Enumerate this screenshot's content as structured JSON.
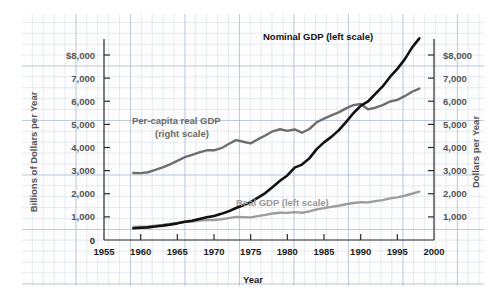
{
  "chart_data": {
    "type": "line",
    "title": "",
    "xlabel": "Year",
    "ylabel_left": "Billions of Dollars per Year",
    "ylabel_right": "Dollars per Year",
    "xlim": [
      1955,
      2000
    ],
    "xticks": [
      "1955",
      "1960",
      "1965",
      "1970",
      "1975",
      "1980",
      "1985",
      "1990",
      "1995",
      "2000"
    ],
    "ylim_left": [
      0,
      8000
    ],
    "ylim_right": [
      0,
      8000
    ],
    "yticks_left": [
      "0",
      "1,000",
      "2,000",
      "3,000",
      "4,000",
      "5,000",
      "6,000",
      "7,000",
      "$8,000"
    ],
    "yticks_right": [
      "1,000",
      "2,000",
      "3,000",
      "4,000",
      "5,000",
      "6,000",
      "7,000",
      "$8,000"
    ],
    "grid": true,
    "legend_position": "inline-annotations",
    "annotations": [
      {
        "name": "nominal-gdp-label",
        "text": "Nominal GDP (left scale)",
        "color": "#111111"
      },
      {
        "name": "per-capita-real-gdp-label",
        "text": "Per-capita real GDP",
        "color": "#6a6a6a"
      },
      {
        "name": "per-capita-real-gdp-sublabel",
        "text": "(right scale)",
        "color": "#6a6a6a"
      },
      {
        "name": "real-gdp-label",
        "text": "Real GDP (left scale)",
        "color": "#9a9a9a"
      }
    ],
    "series": [
      {
        "name": "Nominal GDP (left scale)",
        "axis": "left",
        "color": "#111111",
        "units": "Billions of Dollars per Year",
        "x": [
          1959,
          1960,
          1961,
          1962,
          1963,
          1964,
          1965,
          1966,
          1967,
          1968,
          1969,
          1970,
          1971,
          1972,
          1973,
          1974,
          1975,
          1976,
          1977,
          1978,
          1979,
          1980,
          1981,
          1982,
          1983,
          1984,
          1985,
          1986,
          1987,
          1988,
          1989,
          1990,
          1991,
          1992,
          1993,
          1994,
          1995,
          1996,
          1997,
          1998
        ],
        "values": [
          510,
          530,
          545,
          585,
          620,
          665,
          720,
          790,
          835,
          910,
          985,
          1040,
          1130,
          1240,
          1385,
          1500,
          1640,
          1830,
          2030,
          2290,
          2560,
          2790,
          3130,
          3260,
          3530,
          3930,
          4220,
          4460,
          4740,
          5100,
          5480,
          5800,
          5990,
          6320,
          6640,
          7050,
          7400,
          7810,
          8320,
          8720
        ]
      },
      {
        "name": "Real GDP (left scale)",
        "axis": "left",
        "color": "#9d9d9d",
        "units": "Billions of Dollars per Year",
        "x": [
          1959,
          1960,
          1961,
          1962,
          1963,
          1964,
          1965,
          1966,
          1967,
          1968,
          1969,
          1970,
          1971,
          1972,
          1973,
          1974,
          1975,
          1976,
          1977,
          1978,
          1979,
          1980,
          1981,
          1982,
          1983,
          1984,
          1985,
          1986,
          1987,
          1988,
          1989,
          1990,
          1991,
          1992,
          1993,
          1994,
          1995,
          1996,
          1997,
          1998
        ],
        "values": [
          560,
          575,
          590,
          620,
          650,
          690,
          730,
          780,
          800,
          840,
          865,
          865,
          895,
          945,
          1000,
          990,
          980,
          1035,
          1085,
          1145,
          1180,
          1175,
          1205,
          1180,
          1235,
          1325,
          1380,
          1430,
          1480,
          1545,
          1600,
          1630,
          1625,
          1680,
          1725,
          1800,
          1845,
          1915,
          2000,
          2090
        ]
      },
      {
        "name": "Per-capita real GDP (right scale)",
        "axis": "right",
        "color": "#6f6f6f",
        "units": "Dollars per Year",
        "x": [
          1959,
          1960,
          1961,
          1962,
          1963,
          1964,
          1965,
          1966,
          1967,
          1968,
          1969,
          1970,
          1971,
          1972,
          1973,
          1974,
          1975,
          1976,
          1977,
          1978,
          1979,
          1980,
          1981,
          1982,
          1983,
          1984,
          1985,
          1986,
          1987,
          1988,
          1989,
          1990,
          1991,
          1992,
          1993,
          1994,
          1995,
          1996,
          1997,
          1998
        ],
        "values": [
          2900,
          2890,
          2930,
          3030,
          3140,
          3270,
          3420,
          3580,
          3680,
          3790,
          3880,
          3880,
          3970,
          4150,
          4320,
          4250,
          4180,
          4360,
          4520,
          4700,
          4790,
          4720,
          4780,
          4640,
          4800,
          5090,
          5250,
          5390,
          5520,
          5690,
          5830,
          5880,
          5650,
          5720,
          5830,
          5990,
          6060,
          6220,
          6410,
          6550
        ]
      }
    ]
  },
  "axes": {
    "left_title": "Billions of Dollars per Year",
    "right_title": "Dollars per Year",
    "x_title": "Year"
  }
}
